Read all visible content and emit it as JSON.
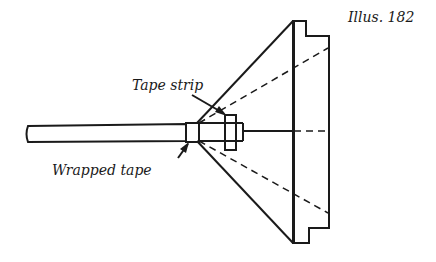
{
  "figure": {
    "caption": "Illus. 182",
    "labels": {
      "tape_strip": "Tape strip",
      "wrapped_tape": "Wrapped tape"
    },
    "parts": [
      "rod",
      "wrapped tape band",
      "tape strip",
      "cone / funnel",
      "flanged rim"
    ],
    "line_color": "#1a1a1a",
    "background": "#ffffff"
  }
}
